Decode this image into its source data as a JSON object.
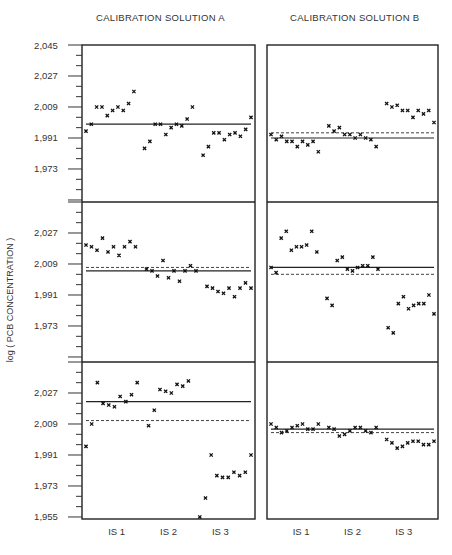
{
  "titles": {
    "a": "CALIBRATION SOLUTION A",
    "b": "CALIBRATION SOLUTION B"
  },
  "ylabel": "log ( PCB CONCENTRATION )",
  "caption": "Figure 4. Ratio for ... (caption partially cut off)",
  "chart_data": {
    "type": "scatter",
    "title": "",
    "ylabel": "log ( PCB CONCENTRATION )",
    "xlabel": "",
    "layout": "3 rows x 2 columns (Calibration Solution A | Calibration Solution B)",
    "column_titles": [
      "CALIBRATION SOLUTION A",
      "CALIBRATION SOLUTION B"
    ],
    "x_tick_labels": [
      "IS 1",
      "IS 2",
      "IS 3"
    ],
    "ylim": [
      1.955,
      2.045
    ],
    "y_ticks": [
      2.045,
      2.027,
      2.009,
      1.991,
      1.973,
      1.955
    ],
    "grid": false,
    "marker": "x",
    "panels": [
      {
        "row": 1,
        "col": "A",
        "solid_line": 1.999,
        "dashed_line": null,
        "values": [
          1.995,
          1.999,
          2.009,
          2.009,
          2.004,
          2.007,
          2.009,
          2.007,
          2.011,
          2.018,
          null,
          1.985,
          1.989,
          1.999,
          1.999,
          1.993,
          1.997,
          1.999,
          1.998,
          2.002,
          2.009,
          null,
          1.981,
          1.986,
          1.994,
          1.994,
          1.99,
          1.993,
          1.994,
          1.992,
          1.996,
          2.003
        ]
      },
      {
        "row": 1,
        "col": "B",
        "solid_line": 1.991,
        "dashed_line": 1.994,
        "values": [
          1.993,
          1.99,
          1.992,
          1.989,
          1.989,
          1.986,
          1.989,
          1.987,
          1.989,
          1.983,
          null,
          1.998,
          1.995,
          1.997,
          1.993,
          1.993,
          1.991,
          1.993,
          1.991,
          1.99,
          1.986,
          null,
          2.011,
          2.009,
          2.01,
          2.007,
          2.007,
          2.003,
          2.007,
          2.005,
          2.007,
          2.0
        ]
      },
      {
        "row": 2,
        "col": "A",
        "solid_line": 2.005,
        "dashed_line": 2.007,
        "values": [
          2.02,
          2.019,
          2.017,
          2.024,
          2.016,
          2.019,
          2.014,
          2.019,
          2.022,
          2.019,
          null,
          2.006,
          2.005,
          2.002,
          2.011,
          2.001,
          2.005,
          1.999,
          2.005,
          2.008,
          2.005,
          null,
          1.996,
          1.995,
          1.993,
          1.992,
          1.995,
          1.99,
          1.995,
          1.998,
          1.995
        ]
      },
      {
        "row": 2,
        "col": "B",
        "solid_line": 2.007,
        "dashed_line": 2.003,
        "values": [
          2.007,
          2.004,
          2.024,
          2.028,
          2.017,
          2.019,
          2.019,
          2.02,
          2.028,
          2.016,
          null,
          1.989,
          1.985,
          2.011,
          2.013,
          2.006,
          2.005,
          2.007,
          2.008,
          2.008,
          2.013,
          2.006,
          null,
          1.972,
          1.969,
          1.986,
          1.99,
          1.983,
          1.985,
          1.986,
          1.986,
          1.991,
          1.98
        ]
      },
      {
        "row": 3,
        "col": "A",
        "solid_line": 2.022,
        "dashed_line": 2.011,
        "values": [
          1.996,
          2.009,
          2.033,
          2.021,
          2.02,
          2.019,
          2.025,
          2.022,
          2.026,
          2.033,
          null,
          2.008,
          2.017,
          2.029,
          2.028,
          2.027,
          2.032,
          2.031,
          2.034,
          null,
          1.955,
          1.966,
          1.991,
          1.979,
          1.978,
          1.978,
          1.981,
          1.979,
          1.981,
          1.991
        ]
      },
      {
        "row": 3,
        "col": "B",
        "solid_line": 2.006,
        "dashed_line": 2.004,
        "values": [
          2.009,
          2.007,
          2.004,
          2.005,
          2.007,
          2.008,
          2.009,
          2.006,
          2.006,
          2.009,
          null,
          2.007,
          2.006,
          2.002,
          2.003,
          2.005,
          2.007,
          2.007,
          2.005,
          2.004,
          2.007,
          null,
          2.0,
          1.998,
          1.995,
          1.996,
          1.998,
          1.999,
          1.999,
          1.997,
          1.997,
          1.999
        ]
      }
    ]
  }
}
